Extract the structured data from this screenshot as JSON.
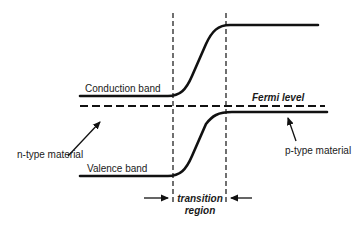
{
  "diagram": {
    "labels": {
      "conduction_band": "Conduction band",
      "valence_band": "Valence band",
      "fermi_level": "Fermi level",
      "n_type": "n-type material",
      "p_type": "p-type material",
      "transition_line1": "transition",
      "transition_line2": "region"
    },
    "colors": {
      "line": "#111111",
      "text": "#1a1a1a",
      "background": "#ffffff"
    }
  }
}
